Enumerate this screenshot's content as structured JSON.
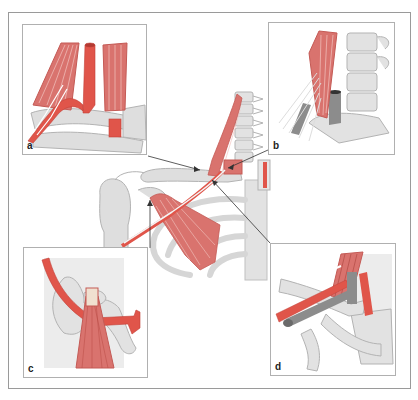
{
  "figure": {
    "colors": {
      "artery": "#e0554a",
      "muscle": "#d9736e",
      "muscle_stripe": "#f2c4c0",
      "bone": "#dedede",
      "bone_stroke": "#b3b3b3",
      "vein": "#8c8c8c",
      "nerve": "#f4f4f4",
      "leader_line": "#333333"
    },
    "panels": [
      {
        "id": "a",
        "label": "a"
      },
      {
        "id": "b",
        "label": "b"
      },
      {
        "id": "c",
        "label": "c"
      },
      {
        "id": "d",
        "label": "d"
      }
    ]
  }
}
